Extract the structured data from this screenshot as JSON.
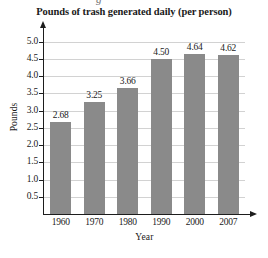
{
  "artifact": {
    "top_fragment": "g"
  },
  "chart_data": {
    "type": "bar",
    "title": "Pounds of trash generated daily (per person)",
    "xlabel": "Year",
    "ylabel": "Pounds",
    "categories": [
      "1960",
      "1970",
      "1980",
      "1990",
      "2000",
      "2007"
    ],
    "values": [
      2.68,
      3.25,
      3.66,
      4.5,
      4.64,
      4.62
    ],
    "value_labels": [
      "2.68",
      "3.25",
      "3.66",
      "4.50",
      "4.64",
      "4.62"
    ],
    "ylim": [
      0,
      5.25
    ],
    "ytick_labels": [
      "5.0",
      "4.5",
      "4.0",
      "3.5",
      "3.0",
      "2.5",
      "2.0",
      "1.5",
      "1.0",
      "0.5"
    ],
    "ytick_values": [
      5.0,
      4.5,
      4.0,
      3.5,
      3.0,
      2.5,
      2.0,
      1.5,
      1.0,
      0.5
    ],
    "grid": true,
    "legend": false,
    "bar_color": "#8a8a8a",
    "gridline_color": "#d2d2d2",
    "axis_color": "#1d1d1d",
    "background_color": "#ffffff"
  }
}
